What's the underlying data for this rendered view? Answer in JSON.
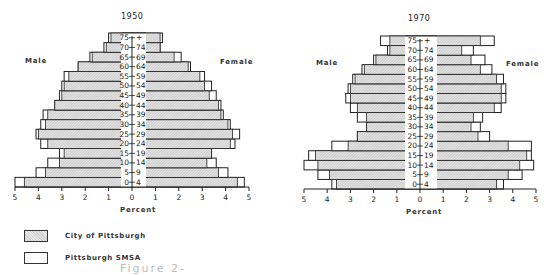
{
  "figure": {
    "caption_fragment": "Figure 2-"
  },
  "legend": {
    "items": [
      {
        "label": "City of Pittsburgh",
        "style": "hatched-gray"
      },
      {
        "label": "Pittsburgh SMSA",
        "style": "white-outline"
      }
    ]
  },
  "labels": {
    "male": "Male",
    "female": "Female",
    "percent": "Percent"
  },
  "colors": {
    "city_fill": "#dcdcdc",
    "smsa_fill": "#ffffff",
    "line": "#222222"
  },
  "chart_data": [
    {
      "type": "bar",
      "subtype": "population-pyramid",
      "title": "1950",
      "xlabel": "Percent",
      "ylabel": "Age group",
      "xlim": [
        -5,
        5
      ],
      "x_ticks": [
        "5",
        "4",
        "3",
        "2",
        "1",
        "0",
        "1",
        "2",
        "3",
        "4",
        "5"
      ],
      "grid": false,
      "legend_position": "bottom-left",
      "categories": [
        "0-4",
        "5-9",
        "10-14",
        "15-19",
        "20-24",
        "25-29",
        "30-34",
        "35-39",
        "40-44",
        "45-49",
        "50-54",
        "55-59",
        "60-64",
        "65-69",
        "70-74",
        "75+"
      ],
      "series": [
        {
          "name": "City of Pittsburgh - Male",
          "values": [
            4.6,
            3.7,
            3.1,
            2.9,
            3.6,
            4.0,
            3.7,
            3.6,
            3.3,
            3.0,
            2.9,
            2.7,
            2.3,
            1.7,
            1.1,
            0.9
          ]
        },
        {
          "name": "Pittsburgh SMSA - Male",
          "values": [
            5.0,
            4.1,
            3.6,
            3.1,
            3.9,
            4.1,
            3.9,
            3.8,
            3.3,
            3.1,
            3.0,
            2.9,
            2.3,
            1.8,
            1.2,
            1.0
          ]
        },
        {
          "name": "City of Pittsburgh - Female",
          "values": [
            4.5,
            3.7,
            3.2,
            3.4,
            4.2,
            4.3,
            4.1,
            3.8,
            3.7,
            3.3,
            3.1,
            2.9,
            2.4,
            1.8,
            1.2,
            1.2
          ]
        },
        {
          "name": "Pittsburgh SMSA - Female",
          "values": [
            4.8,
            4.1,
            3.6,
            3.4,
            4.4,
            4.6,
            4.2,
            3.9,
            3.8,
            3.6,
            3.4,
            3.1,
            2.5,
            2.1,
            1.2,
            1.3
          ]
        }
      ]
    },
    {
      "type": "bar",
      "subtype": "population-pyramid",
      "title": "1970",
      "xlabel": "Percent",
      "ylabel": "Age group",
      "xlim": [
        -5,
        5
      ],
      "x_ticks": [
        "5",
        "4",
        "3",
        "2",
        "1",
        "0",
        "1",
        "2",
        "3",
        "4",
        "5"
      ],
      "grid": false,
      "categories": [
        "0-4",
        "5-9",
        "10-14",
        "15-19",
        "20-24",
        "25-29",
        "30-34",
        "35-39",
        "40-44",
        "45-49",
        "50-54",
        "55-59",
        "60-64",
        "65-69",
        "70-74",
        "75+"
      ],
      "series": [
        {
          "name": "City of Pittsburgh - Male",
          "values": [
            3.6,
            3.9,
            4.4,
            4.5,
            3.1,
            2.7,
            2.3,
            2.3,
            2.7,
            3.0,
            3.0,
            2.8,
            2.4,
            1.9,
            1.3,
            1.3
          ]
        },
        {
          "name": "Pittsburgh SMSA - Male",
          "values": [
            3.8,
            4.4,
            5.0,
            4.8,
            3.8,
            2.7,
            2.3,
            2.7,
            3.0,
            3.2,
            3.1,
            2.9,
            2.5,
            2.0,
            1.4,
            1.7
          ]
        },
        {
          "name": "City of Pittsburgh - Female",
          "values": [
            3.3,
            3.8,
            4.3,
            4.6,
            3.8,
            2.5,
            2.2,
            2.3,
            3.2,
            3.5,
            3.5,
            3.3,
            2.6,
            2.2,
            1.8,
            2.6
          ]
        },
        {
          "name": "Pittsburgh SMSA - Female",
          "values": [
            3.6,
            4.4,
            4.9,
            4.8,
            4.8,
            3.0,
            2.6,
            2.7,
            3.5,
            3.7,
            3.7,
            3.6,
            3.1,
            2.8,
            2.3,
            3.2
          ]
        }
      ]
    }
  ]
}
